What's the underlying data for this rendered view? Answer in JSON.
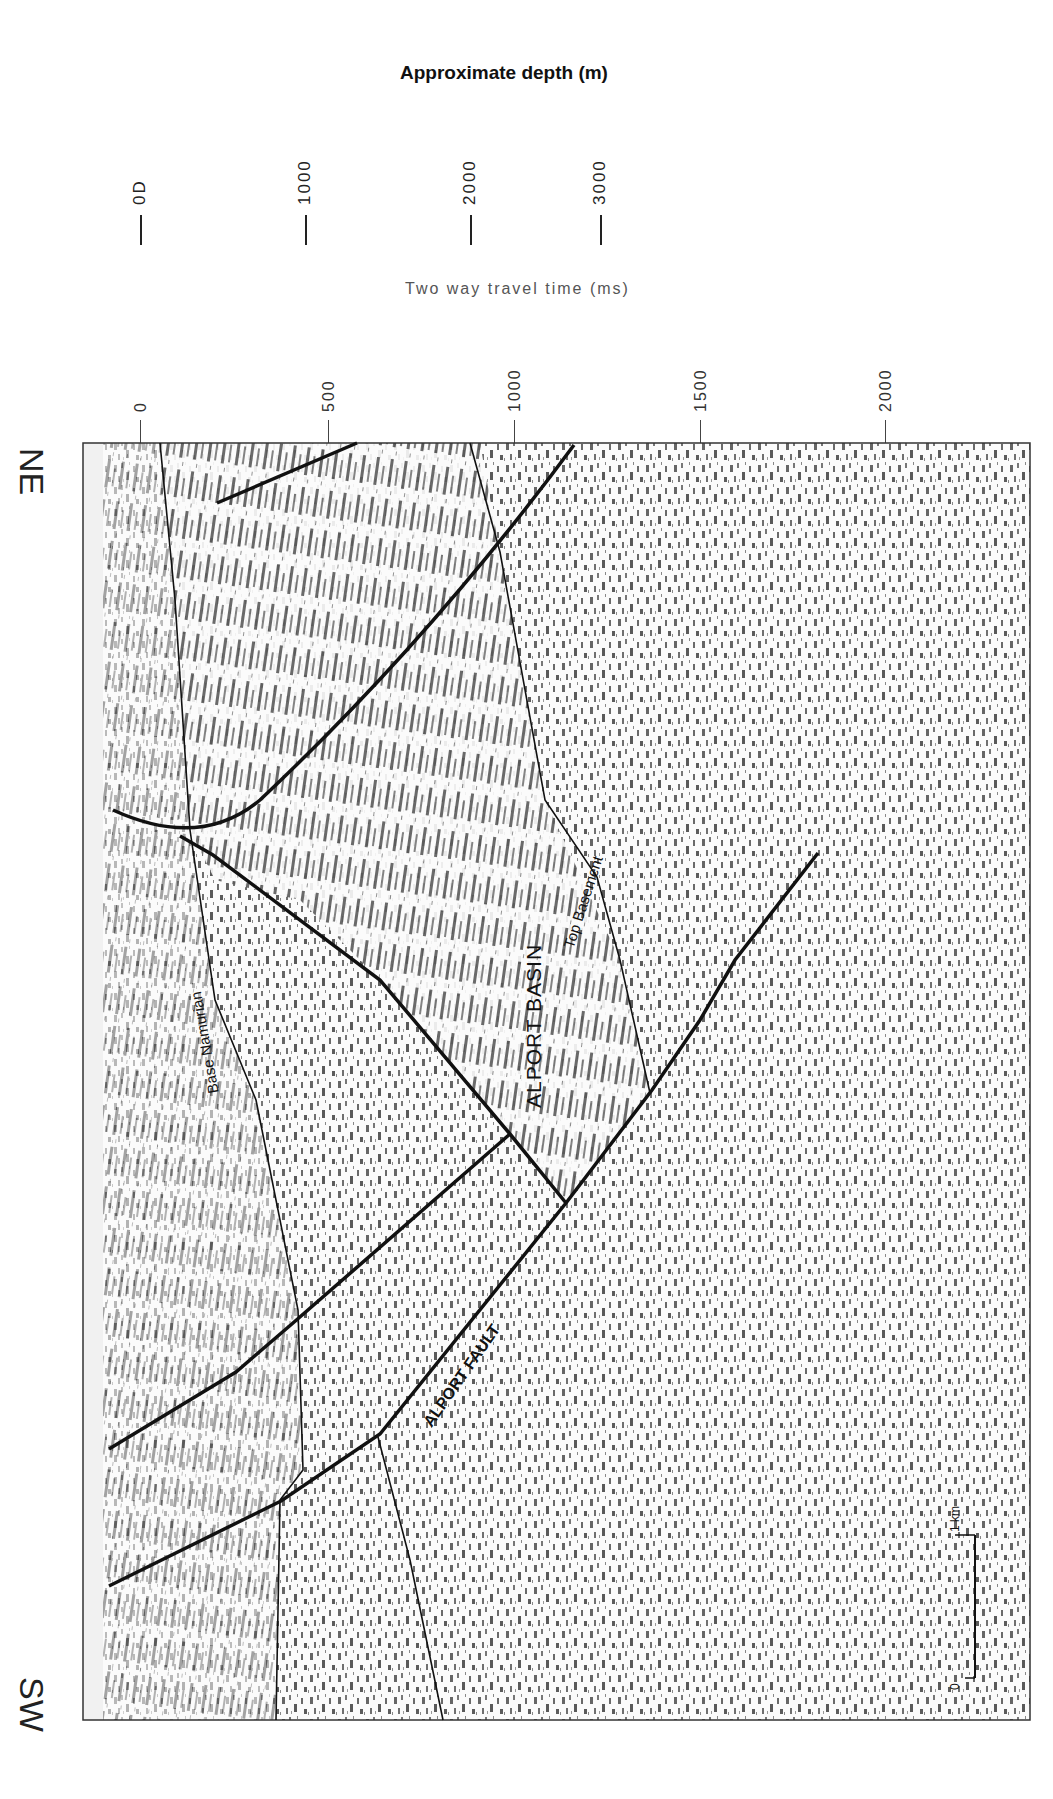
{
  "figure": {
    "orientation_labels": {
      "top": "NE",
      "bottom": "SW"
    },
    "depth_axis": {
      "title": "Approximate depth (m)",
      "ticks": [
        {
          "label": "0D",
          "x": 140
        },
        {
          "label": "1000",
          "x": 305
        },
        {
          "label": "2000",
          "x": 470
        },
        {
          "label": "3000",
          "x": 600
        }
      ]
    },
    "time_axis": {
      "title": "Two way travel time (ms)",
      "ticks": [
        {
          "label": "0",
          "x": 140
        },
        {
          "label": "500",
          "x": 328
        },
        {
          "label": "1000",
          "x": 514
        },
        {
          "label": "1500",
          "x": 700
        },
        {
          "label": "2000",
          "x": 885
        }
      ]
    },
    "interpretation_labels": {
      "base_namurian": "Base Namurian",
      "top_basement": "Top Basement",
      "alport_basin": "ALPORT BASIN",
      "alport_fault": "ALPORT FAULT"
    },
    "scale_bar": {
      "start": "0",
      "end": "1 km"
    },
    "colors": {
      "ink": "#111111",
      "seismic": "#555555",
      "background": "#ffffff"
    }
  }
}
